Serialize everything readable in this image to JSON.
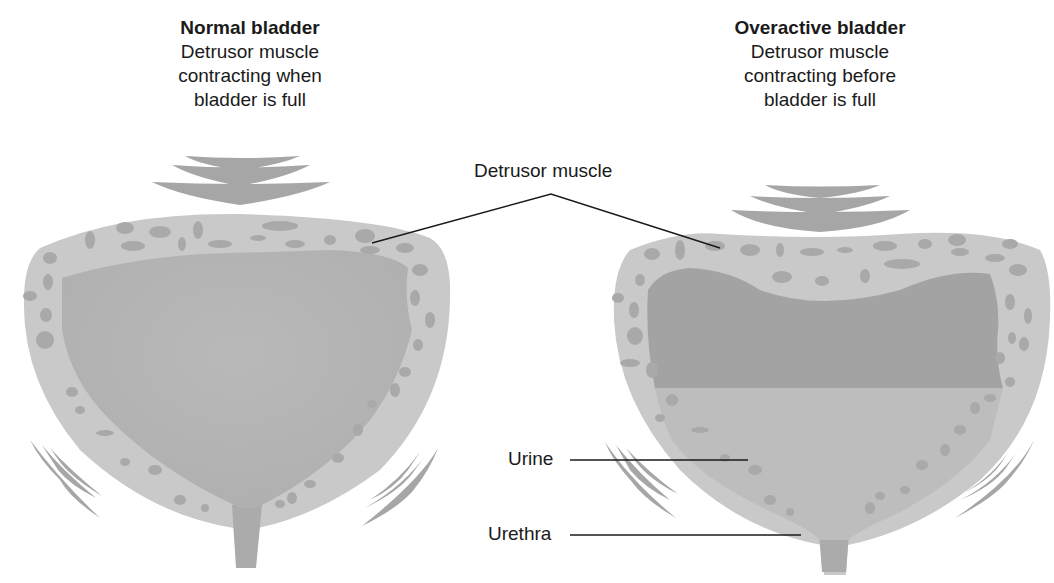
{
  "normal": {
    "title": "Normal bladder",
    "lines": [
      "Detrusor muscle",
      "contracting when",
      "bladder is full"
    ]
  },
  "overactive": {
    "title": "Overactive bladder",
    "lines": [
      "Detrusor muscle",
      "contracting before",
      "bladder is full"
    ]
  },
  "labels": {
    "detrusor": "Detrusor muscle",
    "urine": "Urine",
    "urethra": "Urethra"
  },
  "colors": {
    "wall": "#c9c9c9",
    "muscle_fiber": "#a6a6a6",
    "urine_full": "#b3b3b3",
    "contracted_space": "#a3a3a3",
    "urine_low": "#bdbdbd",
    "leader_line": "#1a1a1a"
  }
}
